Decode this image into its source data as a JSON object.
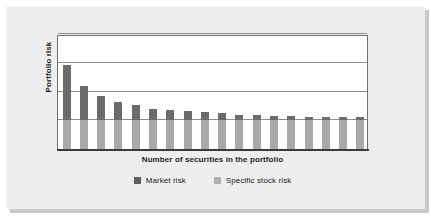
{
  "figure": {
    "background_color": "#eeeeee",
    "plot_background_color": "#ffffff"
  },
  "axes": {
    "y_title": "Portfolio risk",
    "x_title": "Number of securities in the portfolio"
  },
  "legend": {
    "items": [
      {
        "label": "Market risk",
        "color": "#5e5e5e",
        "swatch_name": "legend-swatch-market-risk"
      },
      {
        "label": "Specific stock risk",
        "color": "#b0b0b0",
        "swatch_name": "legend-swatch-specific-stock-risk"
      }
    ]
  },
  "chart_data": {
    "type": "bar",
    "title": "",
    "subtitle": "",
    "xlabel": "Number of securities in the portfolio",
    "ylabel": "Portfolio risk",
    "stacked": true,
    "grid": true,
    "grid_orientation": "horizontal",
    "gridline_values": [
      25,
      50,
      75,
      100
    ],
    "legend_position": "bottom",
    "xlim": [
      0,
      18
    ],
    "ylim": [
      0,
      100
    ],
    "x_tick_labels": [],
    "y_tick_labels": [],
    "categories": [
      1,
      2,
      3,
      4,
      5,
      6,
      7,
      8,
      9,
      10,
      11,
      12,
      13,
      14,
      15,
      16,
      17,
      18
    ],
    "series": [
      {
        "name": "Market risk",
        "color": "#6b6b6b",
        "note": "Dark upper segment of each stacked bar; declines asymptotically as the number of securities rises.",
        "values": [
          48,
          30,
          21,
          16,
          13,
          10,
          9,
          8,
          7,
          6,
          5,
          4.5,
          4,
          3.5,
          3,
          3,
          2.5,
          2.5
        ]
      },
      {
        "name": "Specific stock risk",
        "color": "#a9a9a9",
        "note": "Light lower segment of each stacked bar; constant, undiversifiable floor.",
        "values": [
          25,
          25,
          25,
          25,
          25,
          25,
          25,
          25,
          25,
          25,
          25,
          25,
          25,
          25,
          25,
          25,
          25,
          25
        ]
      }
    ],
    "totals": [
      73,
      55,
      46,
      41,
      38,
      35,
      34,
      33,
      32,
      31,
      30,
      29.5,
      29,
      28.5,
      28,
      28,
      27.5,
      27.5
    ]
  }
}
